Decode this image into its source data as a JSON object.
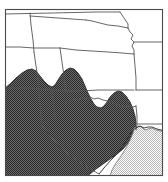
{
  "figure": {
    "kind": "thematic-map",
    "title": "",
    "width": 168,
    "height": 182,
    "background_color": "#ffffff",
    "frame_color": "#4a4a4a"
  },
  "map": {
    "projection_region": "United States — Central and Southern Plains",
    "border_color": "#555555",
    "land_fill": "#ffffff",
    "coastline_color": "#2b2b2b",
    "states": [
      {
        "name": "Wyoming",
        "abbr": "WY",
        "label": "",
        "shaded": "none"
      },
      {
        "name": "South Dakota",
        "abbr": "SD",
        "label": "",
        "shaded": "none"
      },
      {
        "name": "Nebraska",
        "abbr": "NE",
        "label": "",
        "shaded": "none"
      },
      {
        "name": "Iowa",
        "abbr": "IA",
        "label": "",
        "shaded": "none"
      },
      {
        "name": "Colorado",
        "abbr": "CO",
        "label": "",
        "shaded": "partial"
      },
      {
        "name": "Kansas",
        "abbr": "KS",
        "label": "",
        "shaded": "partial"
      },
      {
        "name": "Missouri",
        "abbr": "MO",
        "label": "",
        "shaded": "none"
      },
      {
        "name": "New Mexico",
        "abbr": "NM",
        "label": "",
        "shaded": "dark"
      },
      {
        "name": "Oklahoma",
        "abbr": "OK",
        "label": "",
        "shaded": "partial"
      },
      {
        "name": "Arkansas",
        "abbr": "AR",
        "label": "",
        "shaded": "none"
      },
      {
        "name": "Texas",
        "abbr": "TX",
        "label": "",
        "shaded": "partial"
      },
      {
        "name": "Louisiana",
        "abbr": "LA",
        "label": "",
        "shaded": "light"
      }
    ],
    "regions": [
      {
        "id": "dark-region",
        "name": "dark-shaded-region",
        "fill_pattern": "checker-50",
        "fill_color": "#4d4d4d",
        "outline_color": "#1d1d1d",
        "label": ""
      },
      {
        "id": "light-region",
        "name": "light-shaded-region",
        "fill_pattern": "checker-15",
        "fill_color": "#d6d6d6",
        "outline_color": "#6e6e6e",
        "label": ""
      }
    ]
  }
}
